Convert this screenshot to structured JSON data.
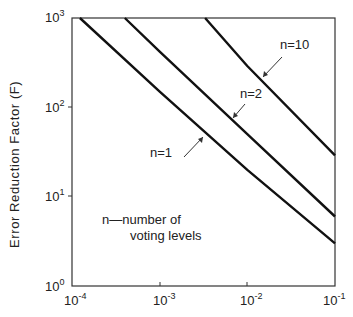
{
  "chart_data": {
    "type": "line",
    "title": "",
    "xlabel": "",
    "ylabel": "Error Reduction Factor (F)",
    "xscale": "log",
    "yscale": "log",
    "xlim": [
      0.0001,
      0.1
    ],
    "ylim": [
      1,
      1000
    ],
    "x_ticks": [
      "10^-4",
      "10^-3",
      "10^-2",
      "10^-1"
    ],
    "y_ticks": [
      "10^0",
      "10^1",
      "10^2",
      "10^3"
    ],
    "grid": false,
    "series": [
      {
        "name": "n=1",
        "x": [
          0.000123,
          0.001,
          0.01,
          0.1
        ],
        "y": [
          1000,
          150,
          20,
          3
        ]
      },
      {
        "name": "n=2",
        "x": [
          0.0004,
          0.001,
          0.01,
          0.1
        ],
        "y": [
          1000,
          420,
          50,
          6
        ]
      },
      {
        "name": "n=10",
        "x": [
          0.0033,
          0.01,
          0.1
        ],
        "y": [
          1000,
          290,
          29
        ]
      }
    ],
    "annotations": [
      {
        "text": "n=10",
        "arrow_to": "n=10 curve"
      },
      {
        "text": "n=2",
        "arrow_to": "n=2 curve"
      },
      {
        "text": "n=1",
        "arrow_to": "n=1 curve"
      },
      {
        "text": "n—number of voting levels"
      }
    ]
  },
  "labels": {
    "ylabel": "Error Reduction Factor (F)",
    "x_ticks": [
      {
        "base": "10",
        "exp": "-4"
      },
      {
        "base": "10",
        "exp": "-3"
      },
      {
        "base": "10",
        "exp": "-2"
      },
      {
        "base": "10",
        "exp": "-1"
      }
    ],
    "y_ticks": [
      {
        "base": "10",
        "exp": "0"
      },
      {
        "base": "10",
        "exp": "1"
      },
      {
        "base": "10",
        "exp": "2"
      },
      {
        "base": "10",
        "exp": "3"
      }
    ],
    "n10": "n=10",
    "n2": "n=2",
    "n1": "n=1",
    "legend_line1": "n—number of",
    "legend_line2": "voting levels"
  }
}
